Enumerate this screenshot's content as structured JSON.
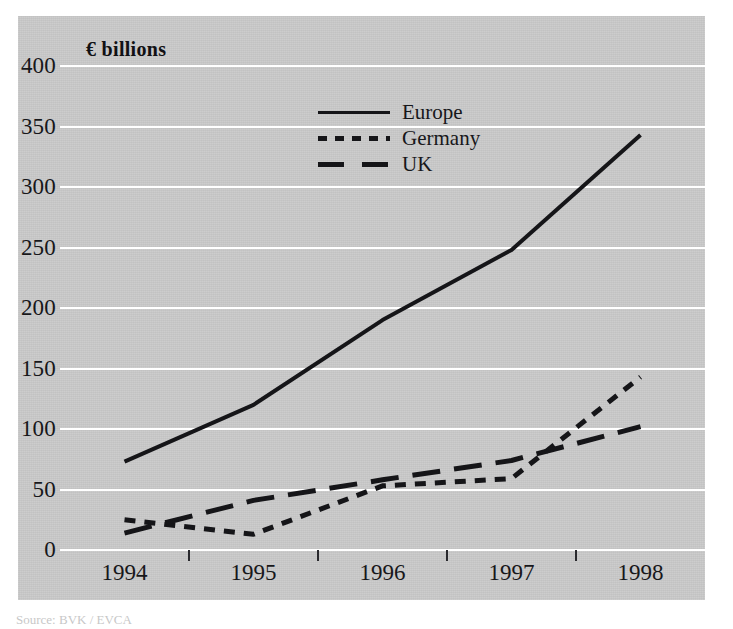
{
  "chart_data": {
    "type": "line",
    "title": "",
    "axis_title": "€ billions",
    "xlabel": "",
    "ylabel": "€ billions",
    "x": [
      "1994",
      "1995",
      "1996",
      "1997",
      "1998"
    ],
    "categories": [
      "1994",
      "1995",
      "1996",
      "1997",
      "1998"
    ],
    "series": [
      {
        "name": "Europe",
        "values": [
          73,
          120,
          190,
          248,
          343
        ],
        "style": "solid",
        "color": "#151518"
      },
      {
        "name": "Germany",
        "values": [
          25,
          13,
          53,
          59,
          143
        ],
        "style": "dotted",
        "color": "#151518"
      },
      {
        "name": "UK",
        "values": [
          14,
          41,
          58,
          74,
          102
        ],
        "style": "dashed",
        "color": "#151518"
      }
    ],
    "ylim": [
      0,
      400
    ],
    "ytick_values": [
      400,
      350,
      300,
      250,
      200,
      150,
      100,
      50,
      0
    ],
    "ytick_labels": [
      "400",
      "350",
      "300",
      "250",
      "200",
      "150",
      "100",
      "50",
      "0"
    ],
    "xtick_labels": [
      "1994",
      "1995",
      "1996",
      "1997",
      "1998"
    ],
    "grid": "horizontal-white",
    "legend_position": "upper-center",
    "panel_color": "#c9c9c9",
    "gridline_color": "#ffffff",
    "line_color": "#151518"
  },
  "legend": {
    "items": [
      {
        "label": "Europe",
        "style": "solid"
      },
      {
        "label": "Germany",
        "style": "dotted"
      },
      {
        "label": "UK",
        "style": "dashed"
      }
    ]
  },
  "footer": {
    "source_text": "Source: BVK / EVCA"
  }
}
